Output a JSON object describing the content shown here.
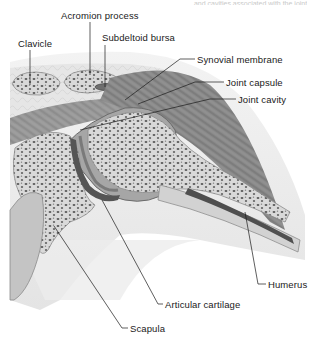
{
  "figure": {
    "title_fragment": "… and cavities associated with the joint",
    "labels": [
      {
        "id": "acromion",
        "text": "Acromion process",
        "x": 61,
        "y": 12
      },
      {
        "id": "clavicle",
        "text": "Clavicle",
        "x": 18,
        "y": 39
      },
      {
        "id": "subdeltoid",
        "text": "Subdeltoid bursa",
        "x": 102,
        "y": 33
      },
      {
        "id": "synovial",
        "text": "Synovial membrane",
        "x": 197,
        "y": 55
      },
      {
        "id": "capsule",
        "text": "Joint capsule",
        "x": 226,
        "y": 77
      },
      {
        "id": "cavity",
        "text": "Joint cavity",
        "x": 238,
        "y": 94
      },
      {
        "id": "humerus",
        "text": "Humerus",
        "x": 268,
        "y": 280
      },
      {
        "id": "cartilage",
        "text": "Articular cartilage",
        "x": 165,
        "y": 300
      },
      {
        "id": "scapula",
        "text": "Scapula",
        "x": 130,
        "y": 324
      }
    ]
  }
}
